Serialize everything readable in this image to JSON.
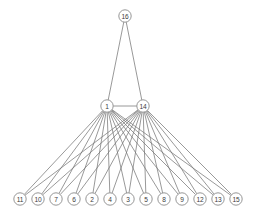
{
  "diagram": {
    "background_color": "#ffffff",
    "edge_color": "#777777",
    "node_fill": "#ffffff",
    "node_stroke": "#8a8a8a",
    "label_color": "#3b3b3b",
    "node_radius": 6.2
  },
  "chart_data": {
    "type": "diagram",
    "title": "",
    "nodes": [
      {
        "id": "16",
        "label": "16",
        "x": 125,
        "y": 16,
        "layer": "top"
      },
      {
        "id": "1",
        "label": "1",
        "x": 107,
        "y": 106,
        "layer": "middle"
      },
      {
        "id": "14",
        "label": "14",
        "x": 143,
        "y": 106,
        "layer": "middle"
      },
      {
        "id": "11",
        "label": "11",
        "x": 20,
        "y": 199,
        "layer": "bottom"
      },
      {
        "id": "10",
        "label": "10",
        "x": 38,
        "y": 199,
        "layer": "bottom"
      },
      {
        "id": "7",
        "label": "7",
        "x": 56,
        "y": 199,
        "layer": "bottom"
      },
      {
        "id": "6",
        "label": "6",
        "x": 74,
        "y": 199,
        "layer": "bottom"
      },
      {
        "id": "2",
        "label": "2",
        "x": 92,
        "y": 199,
        "layer": "bottom"
      },
      {
        "id": "4",
        "label": "4",
        "x": 110,
        "y": 199,
        "layer": "bottom"
      },
      {
        "id": "3",
        "label": "3",
        "x": 128,
        "y": 199,
        "layer": "bottom"
      },
      {
        "id": "5",
        "label": "5",
        "x": 146,
        "y": 199,
        "layer": "bottom"
      },
      {
        "id": "8",
        "label": "8",
        "x": 164,
        "y": 199,
        "layer": "bottom"
      },
      {
        "id": "9",
        "label": "9",
        "x": 182,
        "y": 199,
        "layer": "bottom"
      },
      {
        "id": "12",
        "label": "12",
        "x": 200,
        "y": 199,
        "layer": "bottom"
      },
      {
        "id": "13",
        "label": "13",
        "x": 218,
        "y": 199,
        "layer": "bottom"
      },
      {
        "id": "15",
        "label": "15",
        "x": 236,
        "y": 199,
        "layer": "bottom"
      }
    ],
    "edges": [
      {
        "source": "16",
        "target": "1"
      },
      {
        "source": "16",
        "target": "14"
      },
      {
        "source": "1",
        "target": "14"
      },
      {
        "source": "1",
        "target": "11"
      },
      {
        "source": "1",
        "target": "10"
      },
      {
        "source": "1",
        "target": "7"
      },
      {
        "source": "1",
        "target": "6"
      },
      {
        "source": "1",
        "target": "2"
      },
      {
        "source": "1",
        "target": "4"
      },
      {
        "source": "1",
        "target": "3"
      },
      {
        "source": "1",
        "target": "5"
      },
      {
        "source": "1",
        "target": "8"
      },
      {
        "source": "1",
        "target": "9"
      },
      {
        "source": "1",
        "target": "12"
      },
      {
        "source": "1",
        "target": "13"
      },
      {
        "source": "1",
        "target": "15"
      },
      {
        "source": "14",
        "target": "11"
      },
      {
        "source": "14",
        "target": "10"
      },
      {
        "source": "14",
        "target": "7"
      },
      {
        "source": "14",
        "target": "6"
      },
      {
        "source": "14",
        "target": "2"
      },
      {
        "source": "14",
        "target": "4"
      },
      {
        "source": "14",
        "target": "3"
      },
      {
        "source": "14",
        "target": "5"
      },
      {
        "source": "14",
        "target": "8"
      },
      {
        "source": "14",
        "target": "9"
      },
      {
        "source": "14",
        "target": "12"
      },
      {
        "source": "14",
        "target": "13"
      },
      {
        "source": "14",
        "target": "15"
      }
    ]
  }
}
